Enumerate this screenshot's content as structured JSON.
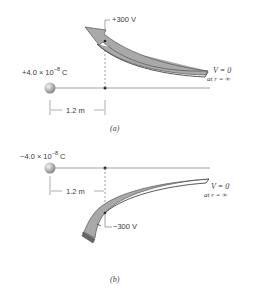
{
  "panel_a": {
    "charge_label": "+4.0 × 10",
    "charge_exp": "−8",
    "charge_unit": " C",
    "distance_label": "1.2 m",
    "potential_label": "+300 V",
    "v_zero_line1": "V = 0",
    "v_zero_line2": "at r = ∞",
    "caption": "(a)"
  },
  "panel_b": {
    "charge_label": "−4.0 × 10",
    "charge_exp": "−8",
    "charge_unit": " C",
    "distance_label": "1.2 m",
    "potential_label": "−300 V",
    "v_zero_line1": "V = 0",
    "v_zero_line2": "at r = ∞",
    "caption": "(b)"
  },
  "colors": {
    "arrow_fill": "#a8a8a8",
    "arrow_edge": "#555555",
    "line": "#777777",
    "sphere": "#b0b0b0"
  }
}
